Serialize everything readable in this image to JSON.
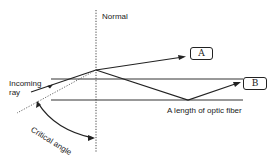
{
  "labels": {
    "normal": "Normal",
    "incoming": "Incoming",
    "ray": "ray",
    "critical_angle": "Critical angle",
    "fiber": "A length of optic fiber",
    "box_a": "A",
    "box_b": "B"
  }
}
